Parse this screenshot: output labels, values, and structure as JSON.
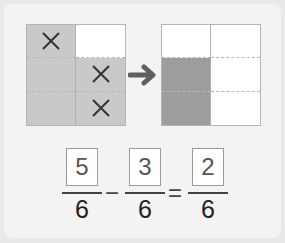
{
  "left_grid": {
    "cells": [
      {
        "fill": "light",
        "mark": "x"
      },
      {
        "fill": "white",
        "mark": ""
      },
      {
        "fill": "light",
        "mark": ""
      },
      {
        "fill": "light",
        "mark": "x"
      },
      {
        "fill": "light",
        "mark": ""
      },
      {
        "fill": "light",
        "mark": "x"
      }
    ]
  },
  "arrow_icon": "right-arrow",
  "right_grid": {
    "cells": [
      {
        "fill": "white"
      },
      {
        "fill": "white"
      },
      {
        "fill": "dark"
      },
      {
        "fill": "white"
      },
      {
        "fill": "dark"
      },
      {
        "fill": "white"
      }
    ]
  },
  "equation": {
    "term1": {
      "numerator": "5",
      "denominator": "6"
    },
    "operator1": "−",
    "term2": {
      "numerator": "3",
      "denominator": "6"
    },
    "operator2": "=",
    "result": {
      "numerator": "2",
      "denominator": "6"
    }
  },
  "colors": {
    "light": "#c9c9c9",
    "dark": "#9d9d9d",
    "white": "#ffffff"
  }
}
